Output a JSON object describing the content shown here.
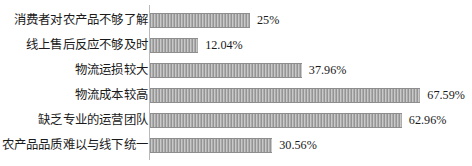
{
  "chart_data": {
    "type": "bar",
    "orientation": "horizontal",
    "title": "",
    "subtitle": "",
    "xlabel": "",
    "ylabel": "",
    "grid": false,
    "legend": false,
    "axis_visible": true,
    "xlim": [
      0,
      70
    ],
    "value_suffix": "%",
    "categories": [
      "消费者对农产品不够了解",
      "线上售后反应不够及时",
      "物流运损较大",
      "物流成本较高",
      "缺乏专业的运营团队",
      "农产品品质难以与线下统一"
    ],
    "values": [
      25,
      12.04,
      37.96,
      67.59,
      62.96,
      30.56
    ],
    "value_labels": [
      "25%",
      "12.04%",
      "37.96%",
      "67.59%",
      "62.96%",
      "30.56%"
    ],
    "bar_color": "#a8a8a8",
    "bar_edge_color": "#8d8d8d",
    "axis_color": "#b9b9b9",
    "text_color": "#1a1a1a",
    "background": "#ffffff",
    "px_per_percent": 4.0
  },
  "rows": [
    {
      "label": "消费者对农产品不够了解",
      "value": 25,
      "value_label": "25%",
      "top": 8
    },
    {
      "label": "线上售后反应不够及时",
      "value": 12.04,
      "value_label": "12.04%",
      "top": 33
    },
    {
      "label": "物流运损较大",
      "value": 37.96,
      "value_label": "37.96%",
      "top": 58
    },
    {
      "label": "物流成本较高",
      "value": 67.59,
      "value_label": "67.59%",
      "top": 83
    },
    {
      "label": "缺乏专业的运营团队",
      "value": 62.96,
      "value_label": "62.96%",
      "top": 108
    },
    {
      "label": "农产品品质难以与线下统一",
      "value": 30.56,
      "value_label": "30.56%",
      "top": 133
    }
  ]
}
